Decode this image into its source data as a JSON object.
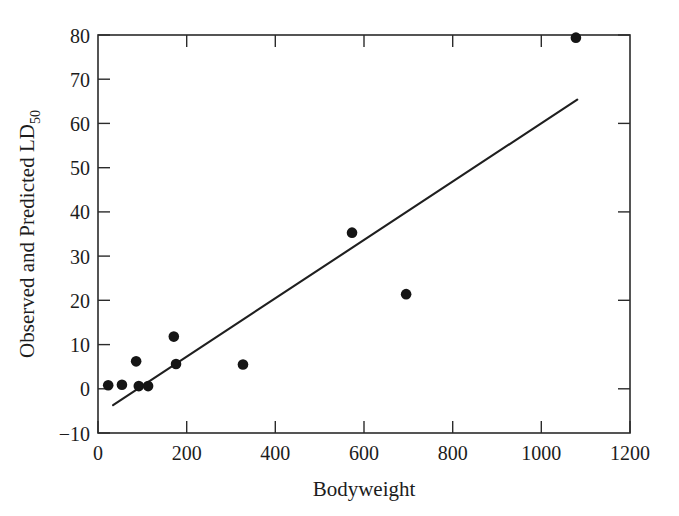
{
  "chart_data": {
    "type": "scatter",
    "title": "",
    "xlabel": "Bodyweight",
    "ylabel": "Observed and Predicted LD",
    "ylabel_subscript": "50",
    "xlim": [
      0,
      1200
    ],
    "ylim": [
      -10,
      80
    ],
    "xticks": [
      0,
      200,
      400,
      600,
      800,
      1000,
      1200
    ],
    "yticks": [
      -10,
      0,
      10,
      20,
      30,
      40,
      50,
      60,
      70,
      80
    ],
    "xticklabels": [
      "0",
      "200",
      "400",
      "600",
      "800",
      "1000",
      "1200"
    ],
    "yticklabels": [
      "−10",
      "0",
      "10",
      "20",
      "30",
      "40",
      "50",
      "60",
      "70",
      "80"
    ],
    "grid": false,
    "legend": null,
    "frame": "box",
    "tick_direction": "in",
    "marker": "filled-circle",
    "marker_color": "#151515",
    "line_color": "#1f1f1f",
    "background_color": "#ffffff",
    "points": [
      {
        "x": 23,
        "y": 0.8
      },
      {
        "x": 54,
        "y": 0.9
      },
      {
        "x": 86,
        "y": 6.2
      },
      {
        "x": 92,
        "y": 0.6
      },
      {
        "x": 113,
        "y": 0.6
      },
      {
        "x": 171,
        "y": 11.8
      },
      {
        "x": 176,
        "y": 5.6
      },
      {
        "x": 327,
        "y": 5.5
      },
      {
        "x": 573,
        "y": 35.3
      },
      {
        "x": 695,
        "y": 21.4
      },
      {
        "x": 1078,
        "y": 79.4
      }
    ],
    "series": [
      {
        "name": "Observed LD50",
        "type": "scatter",
        "x": [
          23,
          54,
          86,
          92,
          113,
          171,
          176,
          327,
          573,
          695,
          1078
        ],
        "values": [
          0.8,
          0.9,
          6.2,
          0.6,
          0.6,
          11.8,
          5.6,
          5.5,
          35.3,
          21.4,
          79.4
        ]
      },
      {
        "name": "Predicted LD50 (fitted line)",
        "type": "line",
        "x": [
          34,
          1081
        ],
        "values": [
          -3.7,
          65.4
        ]
      }
    ],
    "fit_line": {
      "x_start": 34,
      "y_start": -3.7,
      "x_end": 1081,
      "y_end": 65.4,
      "slope": 0.066,
      "intercept": -5.95
    }
  },
  "figure": {
    "axis_title_x": "Bodyweight",
    "axis_title_y_main": "Observed and Predicted LD",
    "axis_title_y_sub": "50"
  }
}
